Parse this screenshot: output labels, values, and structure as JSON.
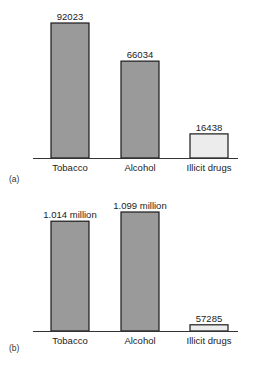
{
  "chart_data": [
    {
      "type": "bar",
      "panel_label": "(a)",
      "title": "",
      "xlabel": "",
      "ylabel": "",
      "categories": [
        "Tobacco",
        "Alcohol",
        "Illicit drugs"
      ],
      "values": [
        92023,
        66034,
        16438
      ],
      "value_labels": [
        "92023",
        "66034",
        "16438"
      ],
      "colors": [
        "#9a9a9a",
        "#9a9a9a",
        "#ececec"
      ],
      "ylim": [
        0,
        92023
      ],
      "grid": false,
      "legend": "none"
    },
    {
      "type": "bar",
      "panel_label": "(b)",
      "title": "",
      "xlabel": "",
      "ylabel": "",
      "categories": [
        "Tobacco",
        "Alcohol",
        "Illicit drugs"
      ],
      "values": [
        1014000,
        1099000,
        57285
      ],
      "value_labels": [
        "1.014 million",
        "1.099 million",
        "57285"
      ],
      "colors": [
        "#9a9a9a",
        "#9a9a9a",
        "#ececec"
      ],
      "ylim": [
        0,
        1099000
      ],
      "grid": false,
      "legend": "none"
    }
  ]
}
